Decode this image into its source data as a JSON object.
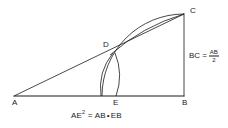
{
  "diagram": {
    "stroke_color": "#1a1a1a",
    "background_color": "#ffffff",
    "points": {
      "A": {
        "label": "A",
        "x": 14,
        "y": 96
      },
      "B": {
        "label": "B",
        "x": 184,
        "y": 96
      },
      "C": {
        "label": "C",
        "x": 184,
        "y": 14
      },
      "D": {
        "label": "D",
        "x": 114,
        "y": 52
      },
      "E": {
        "label": "E",
        "x": 116,
        "y": 96
      }
    },
    "segments": [
      {
        "name": "base-AB",
        "from": "A",
        "to": "B"
      },
      {
        "name": "hypotenuse-AC",
        "from": "A",
        "to": "C"
      },
      {
        "name": "vertical-BC",
        "from": "B",
        "to": "C"
      }
    ],
    "arcs": [
      {
        "name": "arc-C-to-base-center-B",
        "center": "B",
        "radius": 82
      },
      {
        "name": "arc-D-to-C-center-A",
        "center": "A",
        "radius": 182
      },
      {
        "name": "arc-D-to-base-left",
        "center": "A",
        "radius": 105
      },
      {
        "name": "arc-D-to-base-right",
        "center": "B",
        "radius": 78
      }
    ]
  },
  "annotations": {
    "bc_relation": {
      "lhs": "BC",
      "equals": "=",
      "numerator": "AB",
      "denominator": "2"
    },
    "ae_relation": {
      "lhs": "AE",
      "exponent": "2",
      "equals": "=",
      "factor1": "AB",
      "operator": "•",
      "factor2": "EB"
    }
  }
}
